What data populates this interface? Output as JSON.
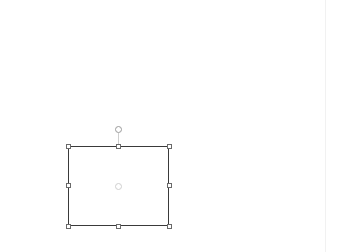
{
  "canvas": {
    "background": "#ffffff",
    "selected_shape": {
      "type": "rectangle",
      "stroke_color": "#3a3a3a",
      "fill": "none",
      "x": 68,
      "y": 146,
      "width": 101,
      "height": 80
    },
    "handles": [
      {
        "id": "top-left",
        "x": 66,
        "y": 144
      },
      {
        "id": "top-middle",
        "x": 116,
        "y": 144
      },
      {
        "id": "top-right",
        "x": 167,
        "y": 144
      },
      {
        "id": "middle-left",
        "x": 66,
        "y": 183
      },
      {
        "id": "middle-right",
        "x": 167,
        "y": 183
      },
      {
        "id": "bottom-left",
        "x": 66,
        "y": 224
      },
      {
        "id": "bottom-middle",
        "x": 116,
        "y": 224
      },
      {
        "id": "bottom-right",
        "x": 167,
        "y": 224
      }
    ],
    "icons": {
      "rotate": "rotate-handle-icon",
      "center": "center-point-icon"
    }
  }
}
